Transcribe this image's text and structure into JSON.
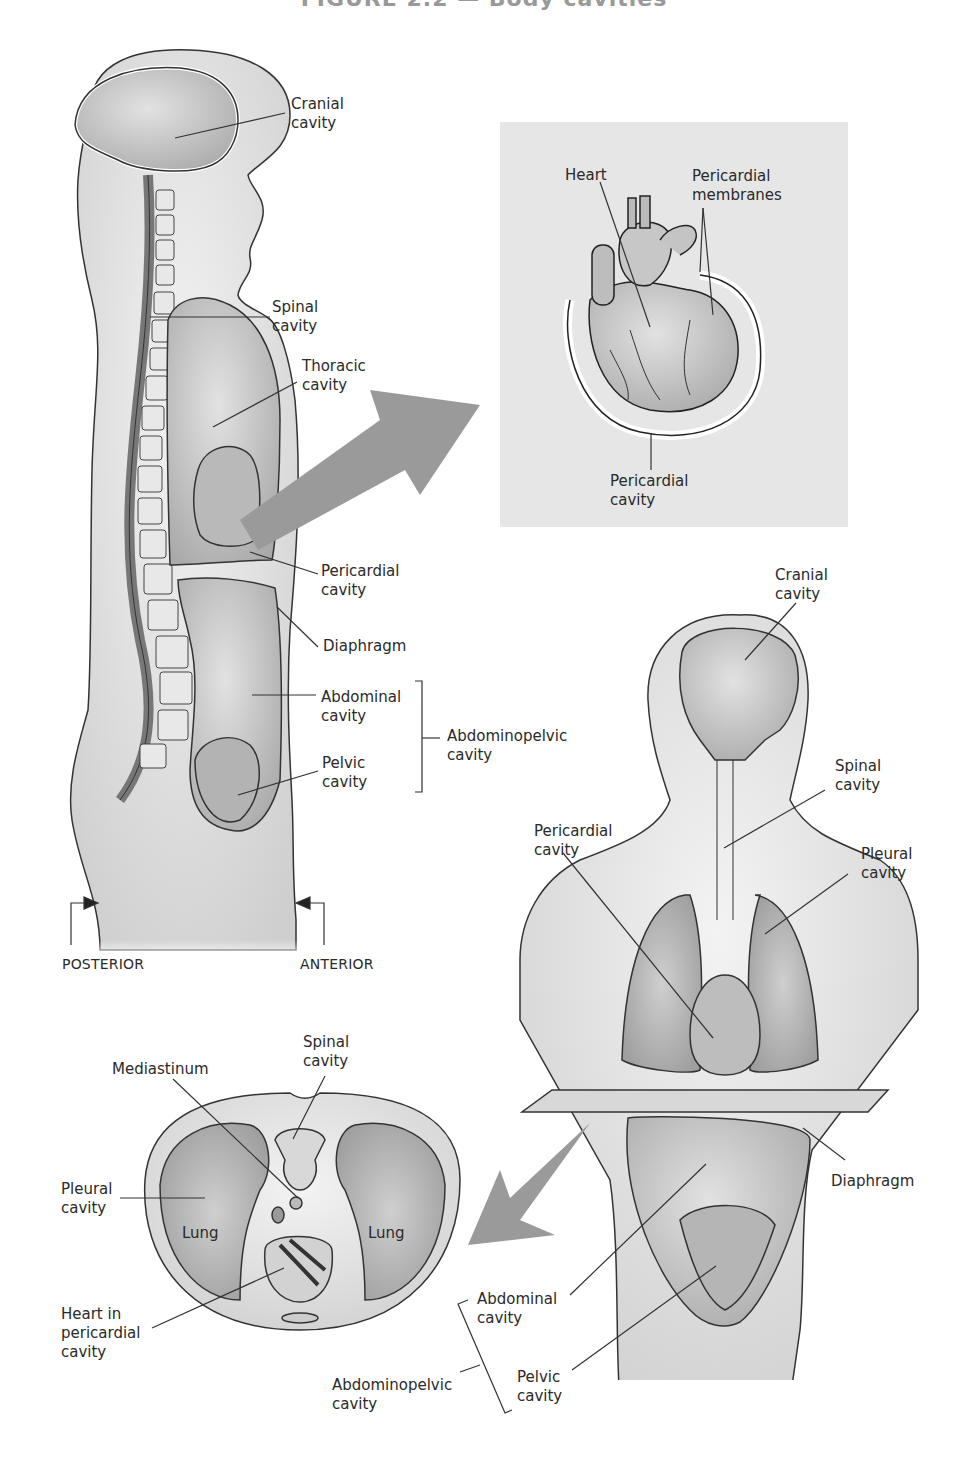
{
  "figure": {
    "title": "FIGURE 2.2 — Body cavities",
    "colors": {
      "ink": "#2a2a2a",
      "body_fill": "#e4e4e4",
      "cavity_fill": "#cfcfcf",
      "inset_bg": "#e6e6e6",
      "arrow": "#9a9a9a"
    }
  },
  "lateral_view": {
    "labels": {
      "cranial": [
        "Cranial",
        "cavity"
      ],
      "spinal": [
        "Spinal",
        "cavity"
      ],
      "thoracic": [
        "Thoracic",
        "cavity"
      ],
      "pericardial": [
        "Pericardial",
        "cavity"
      ],
      "diaphragm": [
        "Diaphragm"
      ],
      "abdominal": [
        "Abdominal",
        "cavity"
      ],
      "pelvic": [
        "Pelvic",
        "cavity"
      ],
      "abdominopelvic": [
        "Abdominopelvic",
        "cavity"
      ]
    },
    "orientation": {
      "posterior": "POSTERIOR",
      "anterior": "ANTERIOR"
    }
  },
  "heart_inset": {
    "labels": {
      "heart": [
        "Heart"
      ],
      "membranes": [
        "Pericardial",
        "membranes"
      ],
      "cavity": [
        "Pericardial",
        "cavity"
      ]
    }
  },
  "anterior_view": {
    "labels": {
      "cranial": [
        "Cranial",
        "cavity"
      ],
      "spinal": [
        "Spinal",
        "cavity"
      ],
      "pericardial": [
        "Pericardial",
        "cavity"
      ],
      "pleural": [
        "Pleural",
        "cavity"
      ],
      "diaphragm": [
        "Diaphragm"
      ],
      "abdominal": [
        "Abdominal",
        "cavity"
      ],
      "pelvic": [
        "Pelvic",
        "cavity"
      ],
      "abdominopelvic": [
        "Abdominopelvic",
        "cavity"
      ]
    }
  },
  "cross_section": {
    "labels": {
      "mediastinum": [
        "Mediastinum"
      ],
      "spinal": [
        "Spinal",
        "cavity"
      ],
      "pleural": [
        "Pleural",
        "cavity"
      ],
      "lung_left": "Lung",
      "lung_right": "Lung",
      "heart": [
        "Heart in",
        "pericardial",
        "cavity"
      ]
    }
  }
}
